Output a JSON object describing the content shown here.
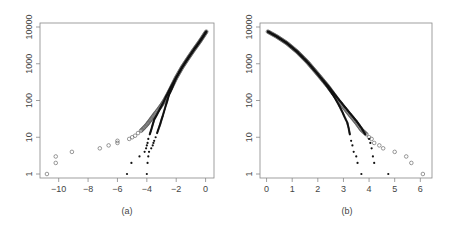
{
  "chart_data": [
    {
      "panel": "(a)",
      "type": "scatter",
      "title": "",
      "xlabel": "",
      "ylabel": "",
      "yscale": "log",
      "xlim": [
        -11,
        0.3
      ],
      "ylim": [
        1,
        10000
      ],
      "xticks": [
        -10,
        -8,
        -6,
        -4,
        -2,
        0
      ],
      "yticks": [
        1,
        10,
        100,
        1000,
        10000
      ],
      "xtick_labels": [
        "−10",
        "−8",
        "−6",
        "−4",
        "−2",
        "0"
      ],
      "ytick_labels": [
        "1",
        "10",
        "100",
        "1000",
        "10000"
      ],
      "grid": false,
      "series": [
        {
          "name": "open circles",
          "marker": "open-circle",
          "points": [
            [
              -10.8,
              1
            ],
            [
              -10.2,
              2
            ],
            [
              -10.2,
              3
            ],
            [
              -9.1,
              4
            ],
            [
              -7.2,
              5
            ],
            [
              -6.6,
              6
            ],
            [
              -6.0,
              7
            ],
            [
              -6.0,
              8
            ],
            [
              -5.2,
              9
            ],
            [
              -5.0,
              10
            ],
            [
              -4.8,
              11
            ],
            [
              -4.6,
              13
            ],
            [
              -4.4,
              15
            ],
            [
              -4.2,
              18
            ],
            [
              -4.0,
              22
            ],
            [
              -3.8,
              28
            ],
            [
              -3.6,
              36
            ],
            [
              -3.4,
              46
            ],
            [
              -3.2,
              58
            ],
            [
              -3.0,
              75
            ],
            [
              -2.8,
              100
            ],
            [
              -2.6,
              140
            ],
            [
              -2.4,
              200
            ],
            [
              -2.2,
              290
            ],
            [
              -2.0,
              420
            ],
            [
              -1.6,
              800
            ],
            [
              -1.2,
              1400
            ],
            [
              -0.8,
              2400
            ],
            [
              -0.4,
              4000
            ],
            [
              0.05,
              7500
            ]
          ]
        },
        {
          "name": "filled dots 1",
          "marker": "filled-dot",
          "points": [
            [
              -5.35,
              1
            ],
            [
              -5.05,
              2
            ],
            [
              -4.5,
              3
            ],
            [
              -4.15,
              4
            ],
            [
              -4.05,
              5
            ],
            [
              -4.0,
              6
            ],
            [
              -3.95,
              7
            ],
            [
              -3.9,
              9
            ],
            [
              -3.8,
              12
            ],
            [
              -3.7,
              16
            ],
            [
              -3.6,
              22
            ],
            [
              -3.5,
              30
            ],
            [
              -3.3,
              42
            ],
            [
              -3.1,
              60
            ],
            [
              -2.9,
              85
            ],
            [
              -2.7,
              125
            ],
            [
              -2.5,
              180
            ],
            [
              -2.3,
              260
            ],
            [
              -2.0,
              420
            ],
            [
              -1.6,
              800
            ],
            [
              -1.2,
              1400
            ],
            [
              -0.8,
              2400
            ],
            [
              -0.4,
              4000
            ],
            [
              0.05,
              7500
            ]
          ]
        },
        {
          "name": "filled dots 2",
          "marker": "filled-dot",
          "points": [
            [
              -4.0,
              1
            ],
            [
              -3.95,
              2
            ],
            [
              -3.9,
              3
            ],
            [
              -3.85,
              4
            ],
            [
              -3.7,
              5
            ],
            [
              -3.6,
              6
            ],
            [
              -3.55,
              7
            ],
            [
              -3.5,
              8
            ],
            [
              -3.4,
              10
            ],
            [
              -3.3,
              13
            ],
            [
              -3.2,
              17
            ],
            [
              -3.1,
              22
            ],
            [
              -3.0,
              30
            ],
            [
              -2.9,
              40
            ],
            [
              -2.8,
              55
            ],
            [
              -2.7,
              75
            ],
            [
              -2.6,
              100
            ],
            [
              -2.5,
              140
            ],
            [
              -2.3,
              210
            ],
            [
              -2.0,
              420
            ],
            [
              -1.6,
              800
            ],
            [
              -1.2,
              1400
            ],
            [
              -0.8,
              2400
            ],
            [
              -0.4,
              4000
            ],
            [
              0.05,
              7500
            ]
          ]
        }
      ]
    },
    {
      "panel": "(b)",
      "type": "scatter",
      "title": "",
      "xlabel": "",
      "ylabel": "",
      "yscale": "log",
      "xlim": [
        -0.1,
        6.3
      ],
      "ylim": [
        1,
        10000
      ],
      "xticks": [
        0,
        1,
        2,
        3,
        4,
        5,
        6
      ],
      "yticks": [
        1,
        10,
        100,
        1000,
        10000
      ],
      "xtick_labels": [
        "0",
        "1",
        "2",
        "3",
        "4",
        "5",
        "6"
      ],
      "ytick_labels": [
        "1",
        "10",
        "100",
        "1000",
        "10000"
      ],
      "grid": false,
      "series": [
        {
          "name": "open circles",
          "marker": "open-circle",
          "points": [
            [
              0.05,
              7500
            ],
            [
              0.4,
              5500
            ],
            [
              0.8,
              3600
            ],
            [
              1.2,
              2100
            ],
            [
              1.6,
              1100
            ],
            [
              2.0,
              520
            ],
            [
              2.4,
              240
            ],
            [
              2.8,
              100
            ],
            [
              3.2,
              45
            ],
            [
              3.5,
              25
            ],
            [
              3.7,
              16
            ],
            [
              3.9,
              12
            ],
            [
              4.0,
              10
            ],
            [
              4.1,
              9
            ],
            [
              4.2,
              7
            ],
            [
              4.4,
              6
            ],
            [
              4.55,
              5
            ],
            [
              5.0,
              4
            ],
            [
              5.45,
              3
            ],
            [
              5.65,
              2
            ],
            [
              6.1,
              1
            ]
          ]
        },
        {
          "name": "filled dots 1",
          "marker": "filled-dot",
          "points": [
            [
              0.05,
              7500
            ],
            [
              0.4,
              5500
            ],
            [
              0.8,
              3600
            ],
            [
              1.2,
              2100
            ],
            [
              1.6,
              1100
            ],
            [
              2.0,
              520
            ],
            [
              2.3,
              280
            ],
            [
              2.6,
              140
            ],
            [
              2.8,
              80
            ],
            [
              2.95,
              50
            ],
            [
              3.05,
              35
            ],
            [
              3.15,
              25
            ],
            [
              3.2,
              18
            ],
            [
              3.25,
              12
            ],
            [
              3.3,
              8
            ],
            [
              3.35,
              6
            ],
            [
              3.4,
              4
            ],
            [
              3.5,
              3
            ],
            [
              3.55,
              2
            ],
            [
              3.7,
              1
            ]
          ]
        },
        {
          "name": "filled dots 2",
          "marker": "filled-dot",
          "points": [
            [
              0.05,
              7500
            ],
            [
              0.4,
              5500
            ],
            [
              0.8,
              3600
            ],
            [
              1.2,
              2100
            ],
            [
              1.6,
              1100
            ],
            [
              2.0,
              520
            ],
            [
              2.4,
              250
            ],
            [
              2.8,
              110
            ],
            [
              3.2,
              50
            ],
            [
              3.5,
              28
            ],
            [
              3.7,
              18
            ],
            [
              3.85,
              12
            ],
            [
              4.0,
              9
            ],
            [
              4.05,
              7
            ],
            [
              4.1,
              5
            ],
            [
              4.15,
              3
            ],
            [
              4.2,
              2
            ],
            [
              4.75,
              1
            ]
          ]
        }
      ]
    }
  ],
  "panels": {
    "a_label": "(a)",
    "b_label": "(b)"
  }
}
